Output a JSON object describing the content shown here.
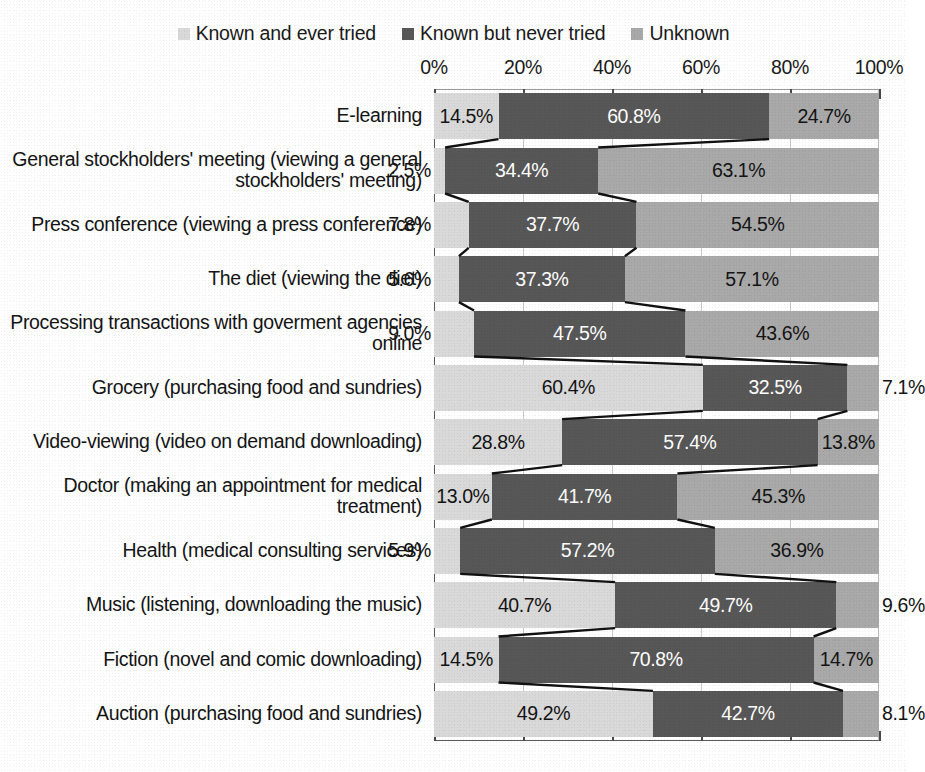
{
  "chart_data": {
    "type": "bar",
    "orientation": "horizontal",
    "stacked": "100%",
    "title": "",
    "xlabel": "",
    "ylabel": "",
    "xlim": [
      0,
      100
    ],
    "grid": true,
    "legend_position": "top",
    "tick_labels": [
      "0%",
      "20%",
      "40%",
      "60%",
      "80%",
      "100%"
    ],
    "tick_values": [
      0,
      20,
      40,
      60,
      80,
      100
    ],
    "series": [
      {
        "name": "Known and ever tried",
        "color": "#d9d9d9",
        "values": [
          14.5,
          2.5,
          7.8,
          5.6,
          9.0,
          60.4,
          28.8,
          13.0,
          5.9,
          40.7,
          14.5,
          49.2
        ]
      },
      {
        "name": "Known but never tried",
        "color": "#575757",
        "values": [
          60.8,
          34.4,
          37.7,
          37.3,
          47.5,
          32.5,
          57.4,
          41.7,
          57.2,
          49.7,
          70.8,
          42.7
        ]
      },
      {
        "name": "Unknown",
        "color": "#a9a9a9",
        "values": [
          24.7,
          63.1,
          54.5,
          57.1,
          43.6,
          7.1,
          13.8,
          45.3,
          36.9,
          9.6,
          14.7,
          8.1
        ]
      }
    ],
    "categories": [
      "E-learning",
      "General stockholders' meeting (viewing a general stockholders' meeting)",
      "Press conference (viewing a press conference)",
      "The diet (viewing the diet)",
      "Processing transactions with goverment agencies online",
      "Grocery (purchasing food and sundries)",
      "Video-viewing (video on demand downloading)",
      "Doctor (making an appointment for medical treatment)",
      "Health (medical consulting services)",
      "Music (listening, downloading the music)",
      "Fiction (novel and comic downloading)",
      "Auction (purchasing food and sundries)"
    ],
    "data_labels": [
      [
        "14.5%",
        "60.8%",
        "24.7%"
      ],
      [
        "2.5%",
        "34.4%",
        "63.1%"
      ],
      [
        "7.8%",
        "37.7%",
        "54.5%"
      ],
      [
        "5.6%",
        "37.3%",
        "57.1%"
      ],
      [
        "9.0%",
        "47.5%",
        "43.6%"
      ],
      [
        "60.4%",
        "32.5%",
        "7.1%"
      ],
      [
        "28.8%",
        "57.4%",
        "13.8%"
      ],
      [
        "13.0%",
        "41.7%",
        "45.3%"
      ],
      [
        "5.9%",
        "57.2%",
        "36.9%"
      ],
      [
        "40.7%",
        "49.7%",
        "9.6%"
      ],
      [
        "14.5%",
        "70.8%",
        "14.7%"
      ],
      [
        "49.2%",
        "42.7%",
        "8.1%"
      ]
    ]
  },
  "legend": {
    "items": [
      {
        "label": "Known and ever tried",
        "swatch": "legend-swatch-known-ever-tried"
      },
      {
        "label": "Known but never tried",
        "swatch": "legend-swatch-known-never-tried"
      },
      {
        "label": "Unknown",
        "swatch": "legend-swatch-unknown"
      }
    ]
  },
  "colors": {
    "series_known_ever_tried": "#d9d9d9",
    "series_known_never_tried": "#575757",
    "series_unknown": "#a9a9a9",
    "connector_line": "#111111",
    "gridline": "#c9c9c9",
    "axis": "#4a4a4a",
    "text": "#141414",
    "background": "#ffffff"
  }
}
